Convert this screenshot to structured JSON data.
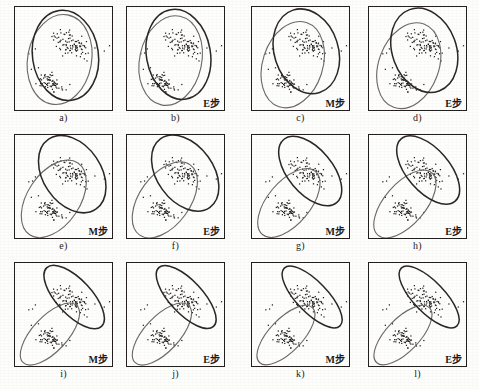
{
  "figure": {
    "title": "",
    "grid": {
      "rows": 3,
      "cols": 4
    },
    "colors": {
      "ellipse_dark": "#2b2724",
      "ellipse_gray": "#6d6a66",
      "point": "#1f1c1a",
      "panel_border": "#231f1d",
      "background": "#fdfdfc"
    },
    "panels": [
      {
        "id": "a",
        "caption": "a)",
        "step": "",
        "cluster1_angle": -22,
        "cluster2_angle": 8,
        "overlap": "high"
      },
      {
        "id": "b",
        "caption": "b)",
        "step": "E步",
        "cluster1_angle": -20,
        "cluster2_angle": 10,
        "overlap": "high"
      },
      {
        "id": "c",
        "caption": "c)",
        "step": "M步",
        "cluster1_angle": -30,
        "cluster2_angle": 18,
        "overlap": "high"
      },
      {
        "id": "d",
        "caption": "d)",
        "step": "E步",
        "cluster1_angle": -32,
        "cluster2_angle": 20,
        "overlap": "high"
      },
      {
        "id": "e",
        "caption": "e)",
        "step": "M步",
        "cluster1_angle": -44,
        "cluster2_angle": 36,
        "overlap": "medium"
      },
      {
        "id": "f",
        "caption": "f)",
        "step": "E步",
        "cluster1_angle": -44,
        "cluster2_angle": 38,
        "overlap": "medium"
      },
      {
        "id": "g",
        "caption": "g)",
        "step": "M步",
        "cluster1_angle": -52,
        "cluster2_angle": 44,
        "overlap": "low"
      },
      {
        "id": "h",
        "caption": "h)",
        "step": "E步",
        "cluster1_angle": -52,
        "cluster2_angle": 45,
        "overlap": "low"
      },
      {
        "id": "i",
        "caption": "i)",
        "step": "M步",
        "cluster1_angle": -56,
        "cluster2_angle": 47,
        "overlap": "low"
      },
      {
        "id": "j",
        "caption": "j)",
        "step": "E步",
        "cluster1_angle": -57,
        "cluster2_angle": 47,
        "overlap": "low"
      },
      {
        "id": "k",
        "caption": "k)",
        "step": "M步",
        "cluster1_angle": -58,
        "cluster2_angle": 48,
        "overlap": "low"
      },
      {
        "id": "l",
        "caption": "l)",
        "step": "E步",
        "cluster1_angle": -58,
        "cluster2_angle": 48,
        "overlap": "low"
      }
    ]
  },
  "chart_data": {
    "type": "scatter",
    "title": "",
    "xlabel": "",
    "ylabel": "",
    "xlim": [
      0,
      100
    ],
    "ylim": [
      0,
      100
    ],
    "grid": false,
    "legend": null,
    "note": "Each of the 12 panels plots the SAME fixed 2-D point cloud (two elongated clusters) with two overlaid confidence ellipses whose center / orientation / size change per EM iteration.",
    "clusters": [
      {
        "name": "upper-right cluster",
        "n_points": 86,
        "center": [
          58,
          64
        ],
        "spread": [
          20,
          11
        ],
        "angle_deg": -28
      },
      {
        "name": "lower-left cluster",
        "n_points": 62,
        "center": [
          36,
          27
        ],
        "spread": [
          15,
          8
        ],
        "angle_deg": -28
      },
      {
        "name": "outliers",
        "n_points": 14,
        "center": [
          50,
          50
        ],
        "spread": [
          44,
          40
        ],
        "angle_deg": 0
      }
    ],
    "ellipse_series": [
      {
        "name": "component 1 (dark)",
        "color": "#2b2724"
      },
      {
        "name": "component 2 (gray)",
        "color": "#6d6a66"
      }
    ],
    "ellipse_params": [
      {
        "panel": "a",
        "e1": {
          "cx": 52,
          "cy": 53,
          "rx": 34,
          "ry": 44,
          "rot": -8
        },
        "e2": {
          "cx": 46,
          "cy": 49,
          "rx": 33,
          "ry": 44,
          "rot": 10
        }
      },
      {
        "panel": "b",
        "e1": {
          "cx": 53,
          "cy": 54,
          "rx": 33,
          "ry": 44,
          "rot": -10
        },
        "e2": {
          "cx": 45,
          "cy": 48,
          "rx": 32,
          "ry": 44,
          "rot": 12
        }
      },
      {
        "panel": "c",
        "e1": {
          "cx": 56,
          "cy": 57,
          "rx": 33,
          "ry": 42,
          "rot": -18
        },
        "e2": {
          "cx": 42,
          "cy": 44,
          "rx": 31,
          "ry": 43,
          "rot": 18
        }
      },
      {
        "panel": "d",
        "e1": {
          "cx": 57,
          "cy": 58,
          "rx": 33,
          "ry": 42,
          "rot": -20
        },
        "e2": {
          "cx": 41,
          "cy": 43,
          "rx": 31,
          "ry": 43,
          "rot": 20
        }
      },
      {
        "panel": "e",
        "e1": {
          "cx": 59,
          "cy": 62,
          "rx": 30,
          "ry": 41,
          "rot": -34
        },
        "e2": {
          "cx": 40,
          "cy": 38,
          "rx": 27,
          "ry": 42,
          "rot": 34
        }
      },
      {
        "panel": "f",
        "e1": {
          "cx": 60,
          "cy": 63,
          "rx": 29,
          "ry": 41,
          "rot": -36
        },
        "e2": {
          "cx": 39,
          "cy": 37,
          "rx": 26,
          "ry": 42,
          "rot": 36
        }
      },
      {
        "panel": "g",
        "e1": {
          "cx": 60,
          "cy": 65,
          "rx": 23,
          "ry": 40,
          "rot": -40
        },
        "e2": {
          "cx": 38,
          "cy": 34,
          "rx": 22,
          "ry": 40,
          "rot": 40
        }
      },
      {
        "panel": "h",
        "e1": {
          "cx": 61,
          "cy": 66,
          "rx": 22,
          "ry": 40,
          "rot": -41
        },
        "e2": {
          "cx": 37,
          "cy": 33,
          "rx": 21,
          "ry": 40,
          "rot": 41
        }
      },
      {
        "panel": "i",
        "e1": {
          "cx": 61,
          "cy": 67,
          "rx": 18,
          "ry": 39,
          "rot": -43
        },
        "e2": {
          "cx": 36,
          "cy": 31,
          "rx": 18,
          "ry": 38,
          "rot": 43
        }
      },
      {
        "panel": "j",
        "e1": {
          "cx": 61,
          "cy": 67,
          "rx": 17,
          "ry": 39,
          "rot": -43
        },
        "e2": {
          "cx": 36,
          "cy": 31,
          "rx": 18,
          "ry": 38,
          "rot": 43
        }
      },
      {
        "panel": "k",
        "e1": {
          "cx": 62,
          "cy": 67,
          "rx": 16,
          "ry": 39,
          "rot": -44
        },
        "e2": {
          "cx": 35,
          "cy": 30,
          "rx": 17,
          "ry": 37,
          "rot": 44
        }
      },
      {
        "panel": "l",
        "e1": {
          "cx": 62,
          "cy": 67,
          "rx": 16,
          "ry": 39,
          "rot": -44
        },
        "e2": {
          "cx": 35,
          "cy": 30,
          "rx": 17,
          "ry": 37,
          "rot": 44
        }
      }
    ]
  }
}
